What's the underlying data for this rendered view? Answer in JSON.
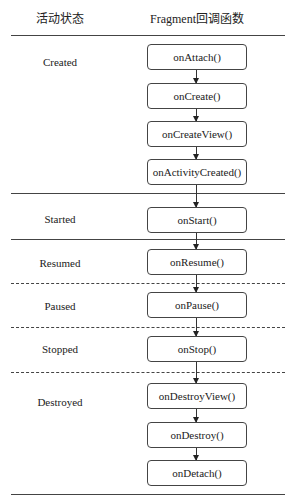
{
  "header": {
    "state_col": "活动状态",
    "callback_col": "Fragment回调函数"
  },
  "states": [
    {
      "name": "Created",
      "callbacks": [
        "onAttach()",
        "onCreate()",
        "onCreateView()",
        "onActivityCreated()"
      ]
    },
    {
      "name": "Started",
      "callbacks": [
        "onStart()"
      ]
    },
    {
      "name": "Resumed",
      "callbacks": [
        "onResume()"
      ]
    },
    {
      "name": "Paused",
      "callbacks": [
        "onPause()"
      ]
    },
    {
      "name": "Stopped",
      "callbacks": [
        "onStop()"
      ]
    },
    {
      "name": "Destroyed",
      "callbacks": [
        "onDestroyView()",
        "onDestroy()",
        "onDetach()"
      ]
    }
  ]
}
